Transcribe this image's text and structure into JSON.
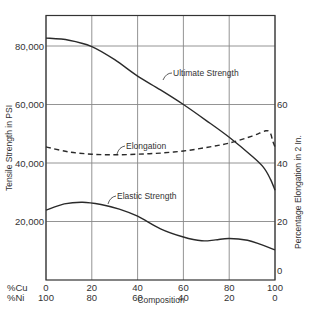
{
  "chart_data": {
    "type": "line",
    "title": "",
    "xlabel": "Composition",
    "x_rows": [
      {
        "label": "%Cu",
        "ticks": [
          "0",
          "20",
          "40",
          "60",
          "80",
          "100"
        ]
      },
      {
        "label": "%Ni",
        "ticks": [
          "100",
          "80",
          "60",
          "40",
          "20",
          "0"
        ]
      }
    ],
    "x": [
      0,
      20,
      40,
      60,
      80,
      100
    ],
    "xlim": [
      0,
      100
    ],
    "ylabel": "Tensile Strength in PSI",
    "ylim": [
      0,
      90000
    ],
    "yticks": [
      20000,
      40000,
      60000,
      80000
    ],
    "ytick_labels": [
      "20,000",
      "40,000",
      "60,000",
      "80,000"
    ],
    "y2label": "Percentage Elongation in 2 In.",
    "y2lim": [
      0,
      90
    ],
    "y2ticks": [
      0,
      20,
      40,
      60
    ],
    "y2tick_labels": [
      "0",
      "20",
      "40",
      "60"
    ],
    "grid": true,
    "legend": "inline annotations",
    "series": [
      {
        "name": "Ultimate Strength",
        "axis": "left",
        "style": "solid",
        "points": [
          [
            0,
            82700
          ],
          [
            10,
            82000
          ],
          [
            20,
            79800
          ],
          [
            30,
            75300
          ],
          [
            40,
            69700
          ],
          [
            50,
            65000
          ],
          [
            60,
            60000
          ],
          [
            70,
            54500
          ],
          [
            80,
            48800
          ],
          [
            90,
            42300
          ],
          [
            95,
            38500
          ],
          [
            98,
            34500
          ],
          [
            100,
            30700
          ]
        ]
      },
      {
        "name": "Elongation",
        "axis": "right",
        "style": "dashed",
        "points": [
          [
            0,
            45.5
          ],
          [
            10,
            43.8
          ],
          [
            20,
            43.0
          ],
          [
            30,
            42.8
          ],
          [
            40,
            43.0
          ],
          [
            50,
            43.4
          ],
          [
            60,
            44.1
          ],
          [
            70,
            45.3
          ],
          [
            80,
            46.8
          ],
          [
            90,
            49.2
          ],
          [
            96,
            51.0
          ],
          [
            98,
            50.2
          ],
          [
            99,
            47.5
          ],
          [
            100,
            45.5
          ]
        ]
      },
      {
        "name": "Elastic Strength",
        "axis": "left",
        "style": "solid",
        "points": [
          [
            0,
            23900
          ],
          [
            8,
            26000
          ],
          [
            16,
            26600
          ],
          [
            24,
            25800
          ],
          [
            32,
            24200
          ],
          [
            40,
            21800
          ],
          [
            50,
            17500
          ],
          [
            60,
            14700
          ],
          [
            68,
            13400
          ],
          [
            74,
            13700
          ],
          [
            80,
            14200
          ],
          [
            88,
            13600
          ],
          [
            94,
            12100
          ],
          [
            100,
            10300
          ]
        ]
      }
    ],
    "annotations": [
      {
        "text": "Ultimate Strength",
        "series": "Ultimate Strength"
      },
      {
        "text": "Elongation",
        "series": "Elongation"
      },
      {
        "text": "Elastic Strength",
        "series": "Elastic Strength"
      }
    ]
  }
}
